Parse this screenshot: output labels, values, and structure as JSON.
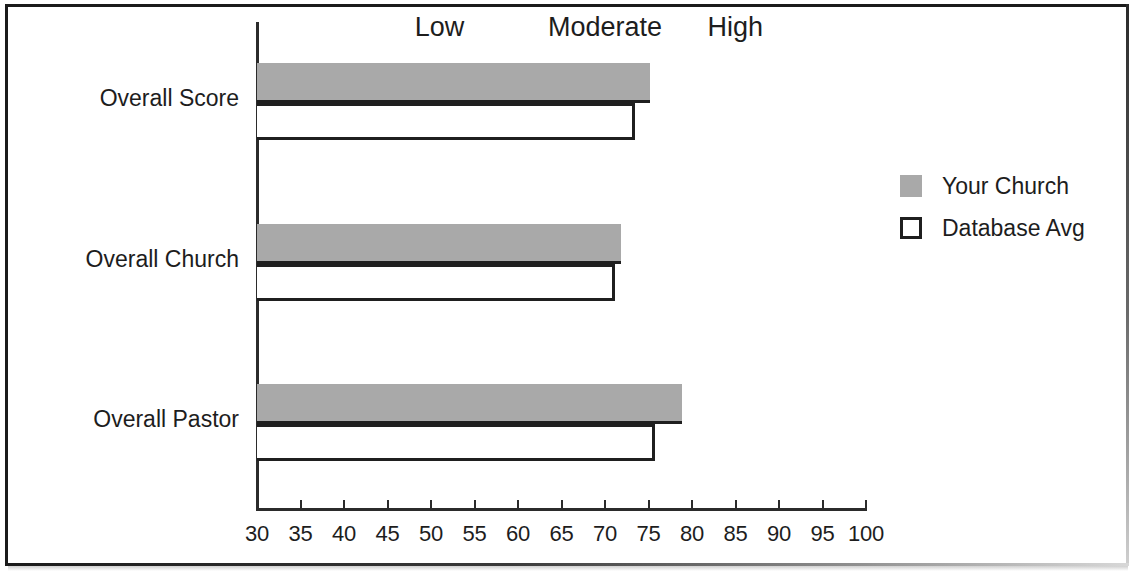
{
  "chart_data": {
    "type": "bar",
    "orientation": "horizontal",
    "title": "",
    "xlabel": "",
    "ylabel": "",
    "categories": [
      "Overall Score",
      "Overall Church",
      "Overall Pastor"
    ],
    "series": [
      {
        "name": "Your Church",
        "values": [
          75.2,
          71.8,
          78.8
        ],
        "color": "#a9a9a9"
      },
      {
        "name": "Database Avg",
        "values": [
          73.5,
          71.1,
          75.8
        ],
        "color": "#ffffff"
      }
    ],
    "xlim": [
      30,
      100
    ],
    "xticks": [
      30,
      35,
      40,
      45,
      50,
      55,
      60,
      65,
      70,
      75,
      80,
      85,
      90,
      95,
      100
    ],
    "xtick_labels": [
      "30",
      "35",
      "40",
      "45",
      "50",
      "55",
      "60",
      "65",
      "70",
      "75",
      "80",
      "85",
      "90",
      "95",
      "100"
    ],
    "grid": false,
    "legend_position": "right",
    "band_labels": [
      {
        "text": "Low",
        "value": 51
      },
      {
        "text": "Moderate",
        "value": 70
      },
      {
        "text": "High",
        "value": 85
      }
    ]
  },
  "legend": {
    "items": [
      {
        "label": "Your Church",
        "swatch": "filled-gray-square"
      },
      {
        "label": "Database Avg",
        "swatch": "outlined-white-square"
      }
    ]
  },
  "colors": {
    "bar_fill": "#a9a9a9",
    "bar_outline": "#1f1f1f",
    "axis": "#2b2b2b",
    "text": "#1d1d1d",
    "background": "#ffffff"
  }
}
